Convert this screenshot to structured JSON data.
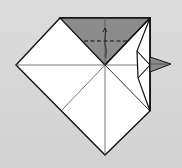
{
  "diagram": {
    "type": "origami-fold-step",
    "background_color": "#d6d6d6",
    "paper_color": "#ffffff",
    "shaded_color": "#8a8a8a",
    "line_color": "#111111",
    "elements": [
      {
        "name": "shaded-top-triangle",
        "kind": "polygon"
      },
      {
        "name": "valley-fold-dashed-line",
        "kind": "dashed-line"
      },
      {
        "name": "fold-arrow",
        "kind": "arrow"
      },
      {
        "name": "side-flap",
        "kind": "polygon"
      },
      {
        "name": "pointer-triangle",
        "kind": "arrowhead"
      }
    ]
  }
}
